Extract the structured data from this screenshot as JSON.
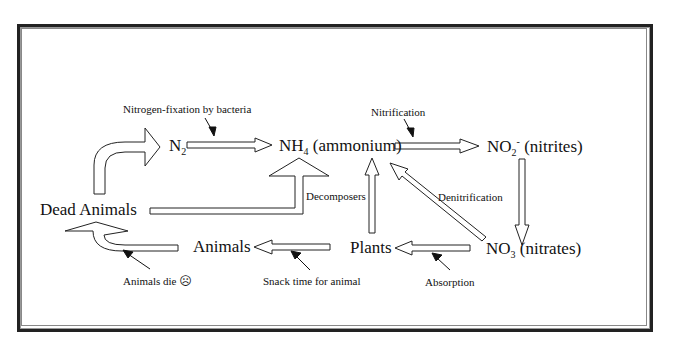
{
  "diagram": {
    "nodes": {
      "n2": {
        "label": "N",
        "sub": "2"
      },
      "nh4": {
        "label": "NH",
        "sub": "4",
        "suffix": " (ammonium)"
      },
      "no2": {
        "label": "NO",
        "sub": "2",
        "sup": "-",
        "suffix": " (nitrites)"
      },
      "no3": {
        "label": "NO",
        "sub": "3",
        "suffix": " (nitrates)"
      },
      "plants": {
        "label": "Plants"
      },
      "animals": {
        "label": "Animals"
      },
      "dead_animals": {
        "label": "Dead Animals"
      }
    },
    "annotations": {
      "nitrogen_fixation": "Nitrogen-fixation by bacteria",
      "nitrification": "Nitrification",
      "denitrification": "Denitrification",
      "decomposers": "Decomposers",
      "absorption": "Absorption",
      "snack_time": "Snack time for animal",
      "animals_die": "Animals die",
      "sad_face": "☹"
    },
    "edges": [
      {
        "from": "Dead Animals",
        "to": "N2"
      },
      {
        "from": "N2",
        "to": "NH4 (ammonium)",
        "label": "Nitrogen-fixation by bacteria"
      },
      {
        "from": "NH4 (ammonium)",
        "to": "NO2- (nitrites)",
        "label": "Nitrification"
      },
      {
        "from": "NO2- (nitrites)",
        "to": "NO3 (nitrates)"
      },
      {
        "from": "NO3 (nitrates)",
        "to": "NH4 (ammonium)",
        "label": "Denitrification"
      },
      {
        "from": "NO3 (nitrates)",
        "to": "Plants",
        "label": "Absorption"
      },
      {
        "from": "Plants",
        "to": "NH4 (ammonium)"
      },
      {
        "from": "Plants",
        "to": "Animals",
        "label": "Snack time for animal"
      },
      {
        "from": "Animals",
        "to": "Dead Animals",
        "label": "Animals die"
      },
      {
        "from": "Dead Animals",
        "to": "NH4 (ammonium)",
        "label": "Decomposers"
      }
    ]
  }
}
